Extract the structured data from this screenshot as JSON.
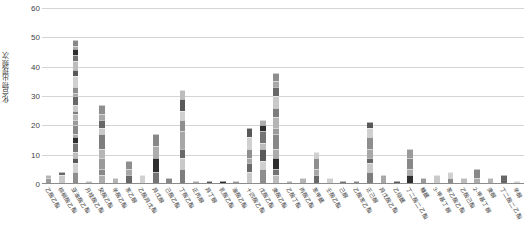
{
  "chart_data": {
    "type": "bar",
    "subtype": "stacked-bar",
    "title": "",
    "xlabel": "",
    "ylabel": "化合物出现频次",
    "ylim": [
      0,
      60
    ],
    "yticks": [
      0,
      10,
      20,
      30,
      40,
      50,
      60
    ],
    "grid": true,
    "legend": "none",
    "orientation": "vertical",
    "stack_palette": [
      "#9a9a9a",
      "#b5b5b5",
      "#7d7d7d",
      "#c9c9c9",
      "#686868",
      "#a7a7a7",
      "#8e8e8e",
      "#d0d0d0",
      "#595959",
      "#bdbdbd",
      "#747474",
      "#2e2e2e",
      "#adadad",
      "#888888"
    ],
    "categories": [
      "乙酸乙酯",
      "棕榈酸乙酯",
      "亚油酸乙酯",
      "月桂酸乙酯",
      "癸酸乙酯",
      "辛酸乙酯",
      "苯乙醇",
      "乙酸异戊酯",
      "异戊醇",
      "己酸乙酯",
      "丁酸乙酯",
      "正丙醇",
      "异丁醇",
      "乳酸乙酯",
      "油酸乙酯",
      "十四酸乙酯",
      "戊酸乙酯",
      "庚酸乙酯",
      "乙酸丁酯",
      "丙酸乙酯",
      "苯甲醛",
      "壬酸乙酯",
      "己醇",
      "乙酸苯乙酯",
      "正己醇",
      "异戊酸乙酯",
      "乙缩醛",
      "丁二酸二乙酯",
      "糠醛",
      "3-甲基丁醇",
      "苯乙酸乙酯",
      "乙酸己酯",
      "2-甲基丁醇",
      "庚醇",
      "丁二酸二乙酯",
      "辛醇"
    ],
    "totals": [
      3,
      4,
      49,
      1,
      27,
      2,
      8,
      3,
      17,
      2,
      32,
      1,
      1,
      1,
      1,
      19,
      22,
      38,
      1,
      2,
      11,
      2,
      1,
      1,
      21,
      3,
      1,
      12,
      2,
      3,
      4,
      2,
      5,
      2,
      3,
      1
    ],
    "stacks": [
      [
        2,
        1
      ],
      [
        3,
        1
      ],
      [
        4,
        3,
        2,
        2,
        3,
        2,
        1,
        3,
        2,
        2,
        1,
        2,
        3,
        1,
        2,
        4,
        2,
        3,
        2,
        2,
        1,
        2
      ],
      [
        1
      ],
      [
        3,
        2,
        4,
        3,
        5,
        2,
        3,
        2,
        3
      ],
      [
        2
      ],
      [
        3,
        2,
        3
      ],
      [
        3
      ],
      [
        4,
        5,
        4,
        4
      ],
      [
        2
      ],
      [
        5,
        4,
        3,
        6,
        4,
        3,
        4,
        3
      ],
      [
        1
      ],
      [
        1
      ],
      [
        1
      ],
      [
        1
      ],
      [
        4,
        3,
        2,
        3,
        4,
        3
      ],
      [
        5,
        3,
        4,
        2,
        4,
        2,
        2
      ],
      [
        3,
        2,
        4,
        3,
        5,
        2,
        4,
        3,
        4,
        3,
        2,
        3
      ],
      [
        1
      ],
      [
        2
      ],
      [
        3,
        2,
        4,
        2
      ],
      [
        2
      ],
      [
        1
      ],
      [
        1
      ],
      [
        4,
        3,
        2,
        3,
        4,
        3,
        2
      ],
      [
        3
      ],
      [
        1
      ],
      [
        3,
        2,
        4,
        3
      ],
      [
        2
      ],
      [
        3
      ],
      [
        2,
        2
      ],
      [
        2
      ],
      [
        2,
        3
      ],
      [
        2
      ],
      [
        3
      ],
      [
        1
      ]
    ]
  }
}
